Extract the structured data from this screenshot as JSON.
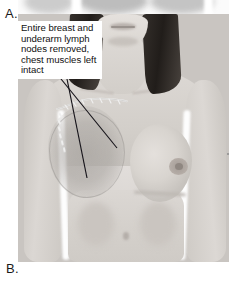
{
  "figure": {
    "type": "medical-illustration",
    "modality": "grayscale-photograph",
    "width_px": 229,
    "height_px": 285
  },
  "panels": {
    "upper_label": "A.",
    "lower_label": "B."
  },
  "annotation": {
    "text": "Entire breast and underarm lymph nodes removed, chest muscles left intact",
    "lines": [
      "Entire breast and",
      "underarm lymph",
      "nodes removed,",
      "chest muscles left",
      "intact"
    ],
    "leader_count": 2,
    "leader_targets": [
      "surgical-scar",
      "flat-chest-wall"
    ]
  },
  "anatomy": {
    "mastectomy_side_label": "right breast removed",
    "intact_side_label": "left breast intact",
    "features": [
      "chin",
      "lips",
      "neck",
      "clavicle",
      "shoulders",
      "left-arm",
      "right-arm",
      "mastectomy-site",
      "surgical-scar",
      "suture-marks",
      "intact-breast",
      "areola",
      "nipple",
      "abdomen",
      "navel",
      "hair"
    ]
  },
  "colors": {
    "background": "#ffffff",
    "skin_light": "#e2dedb",
    "skin_mid": "#d6d2ce",
    "skin_shadow": "#c6c2bd",
    "hair_dark": "#211d1a",
    "scar_line": "#e8e8e8",
    "mastectomy_shade": "#9a9692",
    "leader_line": "#16141a",
    "text": "#111111",
    "label": "#1a1a1a"
  }
}
